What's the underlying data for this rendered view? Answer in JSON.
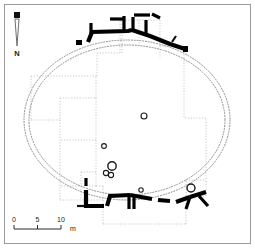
{
  "figure": {
    "kind": "archaeological-site-plan",
    "width": 255,
    "height": 248,
    "background_color": "#ffffff",
    "frame_color": "#9a9a9a"
  },
  "north_arrow": {
    "label": "N",
    "icon": "north-arrow-icon",
    "orientation": "up"
  },
  "scale_bar": {
    "ticks": [
      "0",
      "5",
      "10"
    ],
    "unit": "m",
    "icon": "scale-bar-icon"
  },
  "legend_colors": {
    "wall_masonry": "#000000",
    "enclosure_ditch": "#8d8d8d",
    "excavation_trench": "#c2c2c2"
  },
  "features": {
    "enclosure": {
      "name": "oval-enclosure-ring",
      "style": "double dotted oval",
      "outer_rx": 103,
      "outer_ry": 80,
      "inner_rx": 98,
      "inner_ry": 75,
      "cx": 127,
      "cy": 120
    },
    "north_wall": {
      "name": "north-wall-segment",
      "style": "heavy solid black masonry"
    },
    "south_wall": {
      "name": "south-wall-segment",
      "style": "heavy solid black masonry"
    },
    "trenches": {
      "name": "excavation-trench-grid",
      "style": "fine dotted orthogonal outlines"
    },
    "postholes": {
      "name": "posthole-markers",
      "count": 7,
      "style": "small open circles"
    }
  }
}
